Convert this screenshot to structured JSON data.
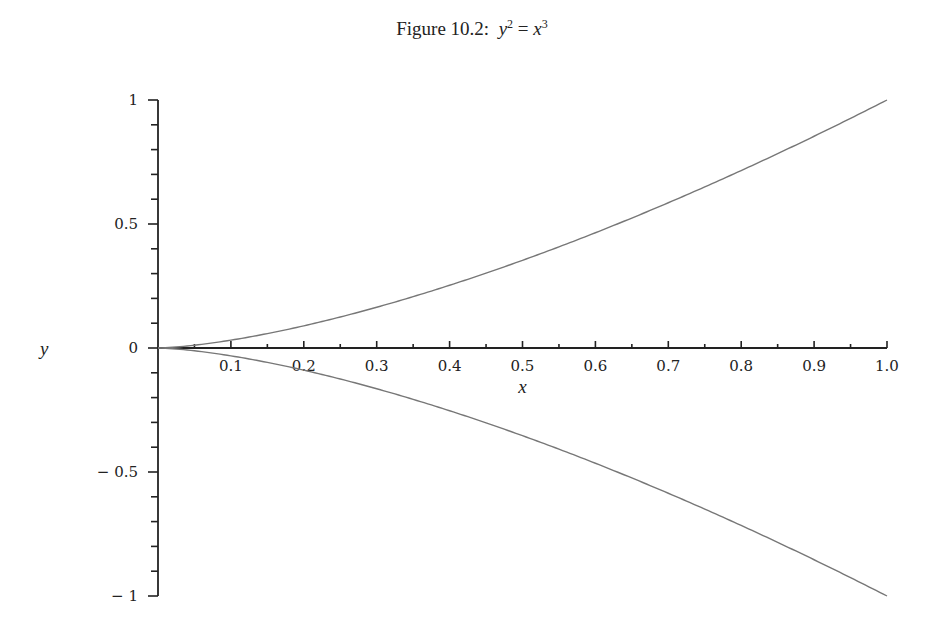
{
  "caption": {
    "prefix": "Figure 10.2:",
    "lhs": "y",
    "lhs_exp": "2",
    "eq": "=",
    "rhs": "x",
    "rhs_exp": "3"
  },
  "chart_data": {
    "type": "line",
    "xlabel": "x",
    "ylabel": "y",
    "xlim": [
      0,
      1.0
    ],
    "ylim": [
      -1,
      1
    ],
    "grid": false,
    "legend": null,
    "x_ticks": [
      "0.1",
      "0.2",
      "0.3",
      "0.4",
      "0.5",
      "0.6",
      "0.7",
      "0.8",
      "0.9",
      "1.0"
    ],
    "y_ticks": [
      "1",
      "0.5",
      "0",
      "-0.5",
      "-1"
    ],
    "series": [
      {
        "name": "y = x^(3/2)",
        "x": [
          0,
          0.1,
          0.2,
          0.3,
          0.4,
          0.5,
          0.6,
          0.7,
          0.8,
          0.9,
          1.0
        ],
        "values": [
          0,
          0.032,
          0.089,
          0.164,
          0.253,
          0.354,
          0.465,
          0.586,
          0.716,
          0.854,
          1.0
        ]
      },
      {
        "name": "y = -x^(3/2)",
        "x": [
          0,
          0.1,
          0.2,
          0.3,
          0.4,
          0.5,
          0.6,
          0.7,
          0.8,
          0.9,
          1.0
        ],
        "values": [
          0,
          -0.032,
          -0.089,
          -0.164,
          -0.253,
          -0.354,
          -0.465,
          -0.586,
          -0.716,
          -0.854,
          -1.0
        ]
      }
    ],
    "colors": {
      "axis": "#222222",
      "curve": "#777777"
    }
  }
}
